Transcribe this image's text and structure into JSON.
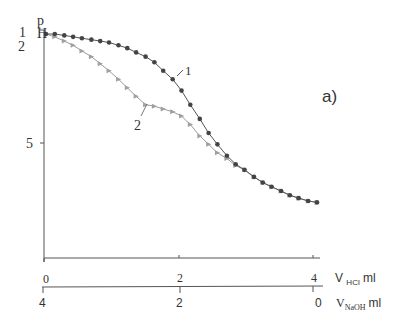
{
  "chart_data": {
    "type": "line",
    "title": "a)",
    "ylabel": "pH",
    "ylabel_parts": [
      "p",
      "H"
    ],
    "y_side_labels": [
      "1",
      "2"
    ],
    "y_ticks": [
      "5"
    ],
    "x_axes": [
      {
        "label": "V HCl ml",
        "label_main": "V",
        "label_sub": "HCl",
        "label_unit": "ml",
        "ticks": [
          "0",
          "2",
          "4"
        ],
        "range": [
          0,
          4
        ]
      },
      {
        "label": "V NaOH ml",
        "label_main": "V",
        "label_sub": "NaOH",
        "label_unit": "ml",
        "ticks": [
          "4",
          "2",
          "0"
        ],
        "range": [
          4,
          0
        ]
      }
    ],
    "series": [
      {
        "name": "1",
        "marker": "circle",
        "color": "#555555",
        "x": [
          0,
          0.13,
          0.27,
          0.4,
          0.53,
          0.67,
          0.8,
          0.93,
          1.07,
          1.2,
          1.33,
          1.47,
          1.6,
          1.73,
          1.87,
          2.0,
          2.13,
          2.27,
          2.4,
          2.53,
          2.67,
          2.8,
          2.93,
          3.07,
          3.2,
          3.33,
          3.47,
          3.6,
          3.73,
          3.87,
          4.0
        ],
        "y": [
          1.2,
          1.2,
          1.25,
          1.3,
          1.35,
          1.4,
          1.45,
          1.5,
          1.6,
          1.7,
          1.85,
          2.0,
          2.2,
          2.5,
          2.8,
          3.2,
          3.7,
          4.2,
          4.7,
          5.1,
          5.5,
          5.8,
          6.0,
          6.25,
          6.45,
          6.6,
          6.75,
          6.9,
          7.0,
          7.1,
          7.15
        ]
      },
      {
        "name": "2",
        "marker": "triangle",
        "color": "#999999",
        "x": [
          0,
          0.13,
          0.27,
          0.4,
          0.53,
          0.67,
          0.8,
          0.93,
          1.07,
          1.2,
          1.33,
          1.47,
          1.6,
          1.73,
          1.87,
          2.0,
          2.13,
          2.27,
          2.4,
          2.53,
          2.67,
          2.8,
          2.93,
          3.07,
          3.2,
          3.33,
          3.47,
          3.6,
          3.73,
          3.87,
          4.0
        ],
        "y": [
          1.2,
          1.3,
          1.45,
          1.6,
          1.8,
          2.0,
          2.25,
          2.5,
          2.8,
          3.1,
          3.4,
          3.7,
          3.75,
          3.85,
          3.95,
          4.1,
          4.4,
          4.8,
          5.1,
          5.4,
          5.6,
          5.85,
          6.0,
          6.25,
          6.45,
          6.6,
          6.75,
          6.9,
          7.0,
          7.1,
          7.15
        ]
      }
    ],
    "annotations": [
      "1",
      "2",
      "a)"
    ],
    "grid": false
  },
  "labels": {
    "p": "p",
    "h": "H",
    "one": "1",
    "two": "2",
    "five": "5",
    "panel": "a)",
    "curve1": "1",
    "curve2": "2",
    "hcl_ticks": [
      "0",
      "2",
      "4"
    ],
    "naoh_ticks": [
      "4",
      "2",
      "0"
    ],
    "hcl_v": "V",
    "hcl_sub": "HCl",
    "hcl_unit": "ml",
    "naoh_v": "V",
    "naoh_sub": "NaOH",
    "naoh_unit": "ml"
  }
}
